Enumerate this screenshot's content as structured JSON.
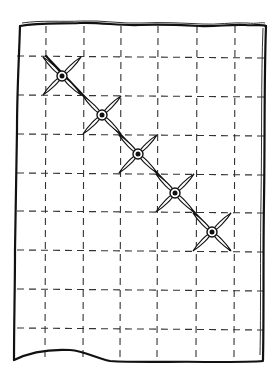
{
  "sketch": {
    "description": "Hand-drawn sheet of paper with a dashed square grid and five cross-stitch marks along the main diagonal",
    "paper": {
      "left": 20,
      "top": 24,
      "right": 266,
      "bottom": 360
    },
    "grid": {
      "columns_x": [
        46,
        84,
        121,
        158,
        197,
        235
      ],
      "rows_y": [
        56,
        95,
        134,
        173,
        211,
        250,
        289,
        328
      ]
    },
    "crosses": [
      {
        "cx": 62,
        "cy": 76
      },
      {
        "cx": 102,
        "cy": 115
      },
      {
        "cx": 138,
        "cy": 154
      },
      {
        "cx": 175,
        "cy": 193
      },
      {
        "cx": 212,
        "cy": 232
      }
    ],
    "colors": {
      "ink": "#111111",
      "grid": "#333333",
      "paper": "#ffffff"
    }
  }
}
